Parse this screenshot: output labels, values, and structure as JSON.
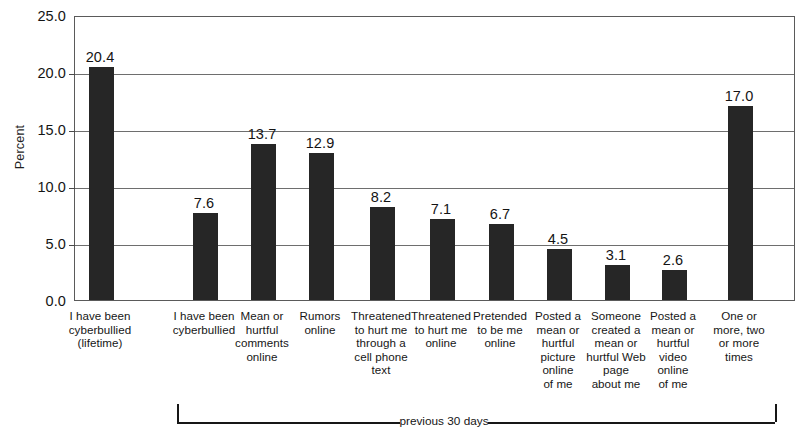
{
  "chart_data": {
    "type": "bar",
    "title": "",
    "subtitle": "",
    "xlabel": "",
    "ylabel": "Percent",
    "ylim": [
      0.0,
      25.0
    ],
    "ytick_step": 5.0,
    "ytick_labels": [
      "0.0",
      "5.0",
      "10.0",
      "15.0",
      "20.0",
      "25.0"
    ],
    "ytick_values": [
      0.0,
      5.0,
      10.0,
      15.0,
      20.0,
      25.0
    ],
    "grid": "horizontal",
    "legend": "none",
    "bar_color": "#262626",
    "categories": [
      "I have been cyberbullied (lifetime)",
      "I have been cyberbullied",
      "Mean or hurtful comments online",
      "Rumors online",
      "Threatened to hurt me through a cell phone text",
      "Threatened to hurt me online",
      "Pretended to be me online",
      "Posted a mean or hurtful picture online of me",
      "Someone created a mean or hurtful Web page about me",
      "Posted a mean or hurtful video online of me",
      "One or more, two or more times"
    ],
    "category_lines": [
      [
        "I have been",
        "cyberbullied",
        "(lifetime)"
      ],
      [
        "I have been",
        "cyberbullied"
      ],
      [
        "Mean or",
        "hurtful",
        "comments",
        "online"
      ],
      [
        "Rumors",
        "online"
      ],
      [
        "Threatened",
        "to hurt me",
        "through a",
        "cell phone",
        "text"
      ],
      [
        "Threatened",
        "to hurt me",
        "online"
      ],
      [
        "Pretended",
        "to be me",
        "online"
      ],
      [
        "Posted a",
        "mean or",
        "hurtful",
        "picture",
        "online",
        "of me"
      ],
      [
        "Someone",
        "created a",
        "mean or",
        "hurtful Web",
        "page",
        "about me"
      ],
      [
        "Posted a",
        "mean or",
        "hurtful",
        "video",
        "online",
        "of me"
      ],
      [
        "One or",
        "more, two",
        "or more",
        "times"
      ]
    ],
    "values": [
      20.4,
      7.6,
      13.7,
      12.9,
      8.2,
      7.1,
      6.7,
      4.5,
      3.1,
      2.6,
      17.0
    ],
    "value_labels": [
      "20.4",
      "7.6",
      "13.7",
      "12.9",
      "8.2",
      "7.1",
      "6.7",
      "4.5",
      "3.1",
      "2.6",
      "17.0"
    ],
    "annotations": [
      {
        "name": "previous-30-days-bracket",
        "label": "previous 30 days",
        "spans_categories": [
          1,
          9
        ]
      }
    ]
  }
}
